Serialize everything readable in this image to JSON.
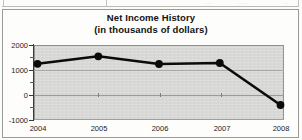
{
  "page": {
    "sliver_fragments": [
      "......",
      "........",
      "....."
    ]
  },
  "chart_data": {
    "type": "line",
    "title": "Net Income History",
    "subtitle": "(in thousands of dollars)",
    "xlabel": "",
    "ylabel": "",
    "categories": [
      "2004",
      "2005",
      "2006",
      "2007",
      "2008"
    ],
    "values": [
      1250,
      1550,
      1240,
      1280,
      -400
    ],
    "series": [
      {
        "name": "Net Income",
        "values": [
          1250,
          1550,
          1240,
          1280,
          -400
        ]
      }
    ],
    "ylim": [
      -1000,
      2000
    ],
    "ytick_labels": [
      "2000",
      "1000",
      "0",
      "-1000"
    ],
    "ytick_values": [
      2000,
      1000,
      0,
      -1000
    ],
    "grid": true,
    "legend": "none",
    "marker": "filled-circle",
    "line_color": "#0b0b0b",
    "plot_background": "#d8d8d6",
    "frame_color": "#9a9a97"
  }
}
